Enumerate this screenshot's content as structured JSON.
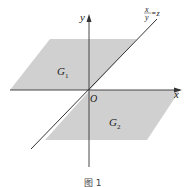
{
  "diagram": {
    "labels": {
      "y_axis": "y",
      "x_axis": "x",
      "origin": "O",
      "region1": "G",
      "region1_sub": "1",
      "region2": "G",
      "region2_sub": "2",
      "line_top": "x",
      "line_eq": "y",
      "line_rhs": "=z"
    },
    "caption": "图 1",
    "colors": {
      "region": "#cfcfcf",
      "axis": "#333333"
    }
  }
}
